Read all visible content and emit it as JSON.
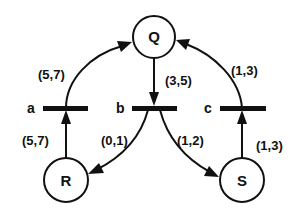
{
  "diagram": {
    "type": "petri-net",
    "places": [
      {
        "id": "Q",
        "label": "Q"
      },
      {
        "id": "R",
        "label": "R"
      },
      {
        "id": "S",
        "label": "S"
      }
    ],
    "transitions": [
      {
        "id": "a",
        "label": "a"
      },
      {
        "id": "b",
        "label": "b"
      },
      {
        "id": "c",
        "label": "c"
      }
    ],
    "arcs": [
      {
        "from": "R",
        "to": "a",
        "label": "(5,7)"
      },
      {
        "from": "a",
        "to": "Q",
        "label": "(5,7)"
      },
      {
        "from": "Q",
        "to": "b",
        "label": "(3,5)"
      },
      {
        "from": "b",
        "to": "R",
        "label": "(0,1)"
      },
      {
        "from": "b",
        "to": "S",
        "label": "(1,2)"
      },
      {
        "from": "S",
        "to": "c",
        "label": "(1,3)"
      },
      {
        "from": "c",
        "to": "Q",
        "label": "(1,3)"
      }
    ],
    "colors": {
      "stroke": "#111111",
      "background": "#ffffff"
    }
  }
}
